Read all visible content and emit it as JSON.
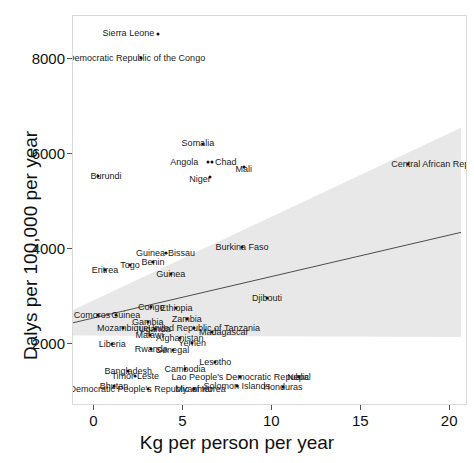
{
  "chart_data": {
    "type": "scatter",
    "title": "",
    "xlabel": "Kg per person per year",
    "ylabel": "Dalys per 100,000 per year",
    "xlim": [
      -1.2,
      21.0
    ],
    "ylim": [
      700,
      8900
    ],
    "xticks": [
      0,
      5,
      10,
      15,
      20
    ],
    "yticks": [
      2000,
      4000,
      6000,
      8000
    ],
    "xticklabels": [
      "0",
      "5",
      "10",
      "15",
      "20"
    ],
    "yticklabels": [
      "2000",
      "4000",
      "6000",
      "8000"
    ],
    "grid": false,
    "legend": null,
    "marker_color": "#111111",
    "trend": {
      "type": "linear-fit",
      "line_color": "#4d4d4d",
      "band_color": "#e8e8e8",
      "band_label": "confidence interval",
      "x_start": -1.2,
      "y_start": 2450,
      "x_end": 20.6,
      "y_end": 4350,
      "band_lower_start": 2180,
      "band_upper_start": 2720,
      "band_lower_end": 2150,
      "band_upper_end": 6550
    },
    "points": [
      {
        "label": "Sierra Leone",
        "x": 3.6,
        "y": 8520,
        "label_dx": -30,
        "label_dy": -1
      },
      {
        "label": "Democratic Republic of the Congo",
        "x": 2.6,
        "y": 8020,
        "label_dx": -4,
        "label_dy": 0
      },
      {
        "label": "Somalia",
        "x": 6.1,
        "y": 6200,
        "label_dx": -5,
        "label_dy": -1
      },
      {
        "label": "Angola",
        "x": 6.4,
        "y": 5830,
        "label_dx": -24,
        "label_dy": 0
      },
      {
        "label": "Chad",
        "x": 6.6,
        "y": 5830,
        "label_dx": 14,
        "label_dy": 0
      },
      {
        "label": "Mali",
        "x": 8.4,
        "y": 5720,
        "label_dx": 0,
        "label_dy": 2
      },
      {
        "label": "Niger",
        "x": 6.5,
        "y": 5520,
        "label_dx": -10,
        "label_dy": 2
      },
      {
        "label": "Central African Republic",
        "x": 17.6,
        "y": 5790,
        "label_dx": 32,
        "label_dy": 0
      },
      {
        "label": "Burundi",
        "x": 0.2,
        "y": 5540,
        "label_dx": 8,
        "label_dy": 0
      },
      {
        "label": "Burkina Faso",
        "x": 8.3,
        "y": 4050,
        "label_dx": 0,
        "label_dy": 0
      },
      {
        "label": "Guinea-Bissau",
        "x": 4.0,
        "y": 3920,
        "label_dx": 0,
        "label_dy": 0
      },
      {
        "label": "Benin",
        "x": 3.3,
        "y": 3720,
        "label_dx": 0,
        "label_dy": 0
      },
      {
        "label": "Togo",
        "x": 2.0,
        "y": 3660,
        "label_dx": 0,
        "label_dy": 0
      },
      {
        "label": "Eritrea",
        "x": 0.6,
        "y": 3560,
        "label_dx": 0,
        "label_dy": 0
      },
      {
        "label": "Guinea",
        "x": 4.3,
        "y": 3480,
        "label_dx": 0,
        "label_dy": 0
      },
      {
        "label": "Djibouti",
        "x": 9.7,
        "y": 2980,
        "label_dx": 0,
        "label_dy": 0
      },
      {
        "label": "Congo",
        "x": 3.2,
        "y": 2780,
        "label_dx": 0,
        "label_dy": 0
      },
      {
        "label": "Ethiopia",
        "x": 4.6,
        "y": 2760,
        "label_dx": 0,
        "label_dy": 0
      },
      {
        "label": "Comoros",
        "x": 0.2,
        "y": 2620,
        "label_dx": -6,
        "label_dy": 0
      },
      {
        "label": "Guinea",
        "x": 1.2,
        "y": 2620,
        "label_dx": 10,
        "label_dy": 0
      },
      {
        "label": "Zambia",
        "x": 5.2,
        "y": 2520,
        "label_dx": 0,
        "label_dy": 0
      },
      {
        "label": "Gambia",
        "x": 3.0,
        "y": 2470,
        "label_dx": 0,
        "label_dy": 0
      },
      {
        "label": "Mozambique",
        "x": 1.6,
        "y": 2340,
        "label_dx": 0,
        "label_dy": 0
      },
      {
        "label": "United Republic of Tanzania",
        "x": 5.6,
        "y": 2330,
        "label_dx": 10,
        "label_dy": 0
      },
      {
        "label": "Madagascar",
        "x": 6.6,
        "y": 2260,
        "label_dx": 12,
        "label_dy": 0
      },
      {
        "label": "Uganda",
        "x": 3.4,
        "y": 2320,
        "label_dx": 0,
        "label_dy": 0
      },
      {
        "label": "Malawi",
        "x": 3.1,
        "y": 2200,
        "label_dx": 0,
        "label_dy": 0
      },
      {
        "label": "Afghanistan",
        "x": 4.8,
        "y": 2130,
        "label_dx": 0,
        "label_dy": 0
      },
      {
        "label": "Liberia",
        "x": 1.0,
        "y": 2000,
        "label_dx": 0,
        "label_dy": 0
      },
      {
        "label": "Yemen",
        "x": 5.5,
        "y": 2020,
        "label_dx": 0,
        "label_dy": 0
      },
      {
        "label": "Rwanda",
        "x": 3.2,
        "y": 1890,
        "label_dx": 0,
        "label_dy": 0
      },
      {
        "label": "Senegal",
        "x": 4.4,
        "y": 1870,
        "label_dx": 0,
        "label_dy": 0
      },
      {
        "label": "Lesotho",
        "x": 6.8,
        "y": 1620,
        "label_dx": 0,
        "label_dy": 0
      },
      {
        "label": "Cambodia",
        "x": 5.1,
        "y": 1480,
        "label_dx": 0,
        "label_dy": 0
      },
      {
        "label": "Bangladesh",
        "x": 1.9,
        "y": 1430,
        "label_dx": 0,
        "label_dy": 0
      },
      {
        "label": "Timor-Leste",
        "x": 2.3,
        "y": 1330,
        "label_dx": 0,
        "label_dy": 0
      },
      {
        "label": "Lao People's Democratic Republic",
        "x": 8.2,
        "y": 1310,
        "label_dx": 0,
        "label_dy": 0
      },
      {
        "label": "Nepal",
        "x": 11.5,
        "y": 1300,
        "label_dx": 0,
        "label_dy": 0
      },
      {
        "label": "Solomon Islands",
        "x": 8.0,
        "y": 1130,
        "label_dx": 0,
        "label_dy": 0
      },
      {
        "label": "Honduras",
        "x": 10.6,
        "y": 1110,
        "label_dx": 0,
        "label_dy": 0
      },
      {
        "label": "Bhutan",
        "x": 1.1,
        "y": 1120,
        "label_dx": 0,
        "label_dy": 0
      },
      {
        "label": "Democratic People's Republic of Korea",
        "x": 3.0,
        "y": 1060,
        "label_dx": 0,
        "label_dy": 0
      },
      {
        "label": "Myanmar",
        "x": 5.6,
        "y": 1060,
        "label_dx": 0,
        "label_dy": 0
      }
    ]
  }
}
